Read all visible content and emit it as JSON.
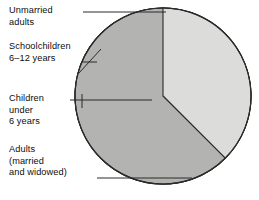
{
  "figure": {
    "title": "",
    "background": "#ffffff",
    "outline_color": "#1a1a1a",
    "shadow_color": "#0b0b0b"
  },
  "labels": {
    "unmarried": {
      "line1": "Unmarried",
      "line2": "adults"
    },
    "schoolchildren": {
      "line1": "Schoolchildren",
      "line2": "6–12 years"
    },
    "children": {
      "line1": "Children",
      "line2": "under",
      "line3": "6 years"
    },
    "adults": {
      "line1": "Adults",
      "line2": "(married",
      "line3": "and widowed)"
    }
  },
  "chart_data": {
    "type": "pie",
    "title": "",
    "xlabel": "",
    "ylabel": "",
    "legend_position": "callout-labels-left",
    "grid": false,
    "center": {
      "x": 163,
      "y": 96
    },
    "radius": 88,
    "start_angle_deg": 0,
    "direction": "clockwise",
    "categories": [
      "Adults (married and widowed)",
      "Children under 6 years",
      "Schoolchildren 6–12 years",
      "Unmarried adults"
    ],
    "values": [
      59.7,
      9.7,
      12.5,
      18.1
    ],
    "unit": "percent",
    "slices": [
      {
        "name": "Adults (married and widowed)",
        "value": 59.7,
        "start_deg": 0,
        "end_deg": 215,
        "fill": "#f4f4f2",
        "stroke": "#2b2b2b",
        "callout": "adults"
      },
      {
        "name": "Children under 6 years",
        "value": 9.7,
        "start_deg": 215,
        "end_deg": 180,
        "fill": "#dcdcda",
        "stroke": "#2b2b2b",
        "callout": "children"
      },
      {
        "name": "Schoolchildren 6–12 years",
        "value": 12.5,
        "start_deg": 180,
        "end_deg": 135,
        "fill": "#dcdcda",
        "stroke": "#2b2b2b",
        "callout": "schoolchildren"
      },
      {
        "name": "Unmarried adults",
        "value": 18.1,
        "start_deg": 135,
        "end_deg": 0,
        "fill": "#b3b3b1",
        "stroke": "#2b2b2b",
        "callout": "unmarried"
      }
    ]
  }
}
